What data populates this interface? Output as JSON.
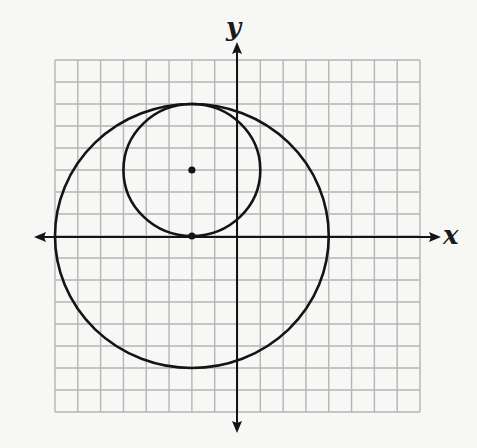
{
  "diagram": {
    "type": "coordinate-plane",
    "axes": {
      "x_label": "x",
      "y_label": "y"
    },
    "grid": {
      "x_min": -8,
      "x_max": 8,
      "y_min": -8,
      "y_max": 8,
      "step": 1
    },
    "circles": [
      {
        "name": "small-circle",
        "center": [
          -2,
          3
        ],
        "radius": 3
      },
      {
        "name": "large-circle",
        "center": [
          -2,
          0
        ],
        "radius": 6
      }
    ],
    "points": [
      {
        "name": "small-circle-center",
        "coords": [
          -2,
          3
        ]
      },
      {
        "name": "large-circle-center",
        "coords": [
          -2,
          0
        ]
      }
    ],
    "colors": {
      "grid": "#b4b4b4",
      "ink": "#141414",
      "background": "#f7f7f5"
    }
  }
}
